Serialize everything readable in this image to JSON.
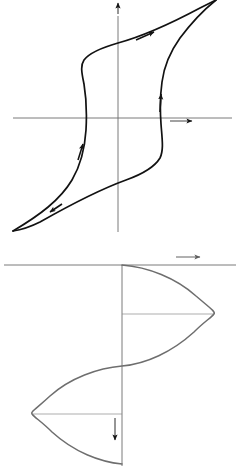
{
  "figure": {
    "background_color": "#ffffff",
    "ink_color": "#000000",
    "axis_color": "#6b6b6b",
    "curve_color_top": "#111111",
    "curve_color_bottom": "#6e6e6e"
  },
  "chart_data": [
    {
      "type": "line",
      "name": "hysteresis-loop",
      "title": "",
      "xlabel": "H",
      "ylabel": "B",
      "xlim": [
        -1.15,
        1.15
      ],
      "ylim": [
        -1.15,
        1.15
      ],
      "grid": false,
      "legend": "none",
      "axis_arrows": {
        "x": "right",
        "y": "up"
      },
      "annotations": [
        {
          "label": "t",
          "sub": "1",
          "x": 1.02,
          "y": 1.08,
          "note": "positive saturation tip, upper right"
        },
        {
          "label": "t",
          "sub": "2",
          "x": -0.06,
          "y": 0.62,
          "note": "remanence on ascending branch, B axis crossing"
        },
        {
          "label": "t",
          "sub": "3",
          "x": -1.0,
          "y": -1.05,
          "note": "negative saturation tip, lower left"
        },
        {
          "label": "t",
          "sub": "5",
          "x": -0.12,
          "y": -0.6,
          "note": "descending branch near origin, left of B axis"
        },
        {
          "label": "t",
          "sub": "0",
          "x": 0.08,
          "y": -0.6,
          "note": "starting point on B axis, lower"
        }
      ],
      "series": [
        {
          "name": "ascending-branch",
          "direction": "upward-right",
          "arrow_positions": [
            0.3,
            0.78
          ],
          "points": [
            [
              -1.0,
              -1.05
            ],
            [
              -0.84,
              -0.93
            ],
            [
              -0.66,
              -0.8
            ],
            [
              -0.5,
              -0.66
            ],
            [
              -0.38,
              -0.5
            ],
            [
              -0.3,
              -0.32
            ],
            [
              -0.26,
              -0.12
            ],
            [
              -0.25,
              0.08
            ],
            [
              -0.26,
              0.26
            ],
            [
              -0.3,
              0.42
            ],
            [
              -0.36,
              0.56
            ],
            [
              -0.24,
              0.66
            ],
            [
              -0.04,
              0.73
            ],
            [
              0.2,
              0.8
            ],
            [
              0.48,
              0.88
            ],
            [
              0.75,
              0.98
            ],
            [
              1.0,
              1.08
            ]
          ]
        },
        {
          "name": "descending-branch",
          "direction": "downward-left",
          "arrow_positions": [
            0.3,
            0.78
          ],
          "points": [
            [
              1.0,
              1.08
            ],
            [
              0.8,
              0.92
            ],
            [
              0.62,
              0.76
            ],
            [
              0.48,
              0.58
            ],
            [
              0.38,
              0.38
            ],
            [
              0.32,
              0.18
            ],
            [
              0.3,
              -0.02
            ],
            [
              0.3,
              -0.22
            ],
            [
              0.33,
              -0.4
            ],
            [
              0.38,
              -0.55
            ],
            [
              0.26,
              -0.64
            ],
            [
              0.06,
              -0.7
            ],
            [
              -0.2,
              -0.78
            ],
            [
              -0.48,
              -0.86
            ],
            [
              -0.74,
              -0.96
            ],
            [
              -1.0,
              -1.05
            ]
          ]
        }
      ]
    },
    {
      "type": "line",
      "name": "sinusoidal-excitation",
      "title": "",
      "xlabel": "u",
      "ylabel": "t",
      "orientation": "time-downward",
      "xlim": [
        -1.15,
        1.15
      ],
      "tlim": [
        0,
        1
      ],
      "grid": false,
      "legend": "none",
      "axis_arrows": {
        "x": "right",
        "t": "down"
      },
      "description": "One full sine period u(t) drawn with time increasing downward along the vertical axis",
      "annotations": [
        {
          "label": "t",
          "sub": "0",
          "t": 0.0,
          "u": 0.0,
          "tick": false,
          "note": "start of period at u axis"
        },
        {
          "label": "t",
          "sub": "1",
          "t": 0.25,
          "u": 1.0,
          "tick": true,
          "note": "positive peak, leader line to curve"
        },
        {
          "label": "t",
          "sub": "2",
          "t": 0.5,
          "u": 0.0,
          "tick": false,
          "note": "zero crossing, descending"
        },
        {
          "label": "t",
          "sub": "3",
          "t": 0.75,
          "u": -1.0,
          "tick": true,
          "note": "negative peak, leader line to curve"
        },
        {
          "label": "t",
          "sub": "4",
          "t": 1.0,
          "u": 0.0,
          "tick": false,
          "note": "end of period"
        }
      ],
      "series": [
        {
          "name": "u(t)",
          "t": [
            0.0,
            0.05,
            0.1,
            0.15,
            0.2,
            0.25,
            0.3,
            0.35,
            0.4,
            0.45,
            0.5,
            0.55,
            0.6,
            0.65,
            0.7,
            0.75,
            0.8,
            0.85,
            0.9,
            0.95,
            1.0
          ],
          "values": [
            0.0,
            0.31,
            0.59,
            0.81,
            0.95,
            1.0,
            0.95,
            0.81,
            0.59,
            0.31,
            0.0,
            -0.31,
            -0.59,
            -0.81,
            -0.95,
            -1.0,
            -0.95,
            -0.81,
            -0.59,
            -0.31,
            0.0
          ]
        }
      ]
    }
  ],
  "top_chart": {
    "axis_x_label": "H",
    "axis_y_label": "B",
    "labels": {
      "t1": {
        "base": "t",
        "sub": "1"
      },
      "t2": {
        "base": "t",
        "sub": "2"
      },
      "t3": {
        "base": "t",
        "sub": "3"
      },
      "t5": {
        "base": "t",
        "sub": "5"
      },
      "t0": {
        "base": "t",
        "sub": "0"
      }
    }
  },
  "bottom_chart": {
    "axis_x_label": "u",
    "axis_t_label": "t",
    "labels": {
      "t0": {
        "base": "t",
        "sub": "0"
      },
      "t1": {
        "base": "t",
        "sub": "1"
      },
      "t2": {
        "base": "t",
        "sub": "2"
      },
      "t3": {
        "base": "t",
        "sub": "3"
      },
      "t4": {
        "base": "t",
        "sub": "4"
      }
    }
  }
}
